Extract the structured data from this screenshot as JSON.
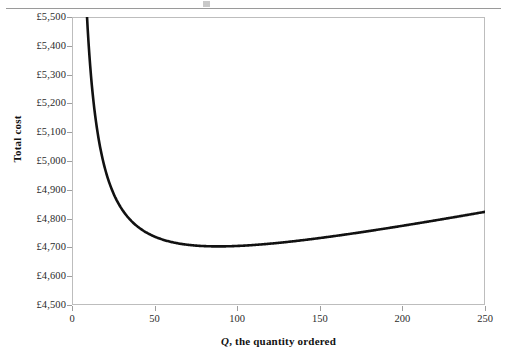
{
  "figure": {
    "top_rule": "horizontal-rule"
  },
  "chart_data": {
    "type": "line",
    "title": "",
    "subtitle": "",
    "xlabel_symbol": "Q",
    "xlabel_rest": ", the quantity ordered",
    "xlabel": "Q, the quantity ordered",
    "ylabel": "Total cost",
    "currency_symbol": "£",
    "grid": false,
    "legend": "none",
    "xlim": [
      0,
      250
    ],
    "ylim": [
      4500,
      5500
    ],
    "xticks": [
      0,
      50,
      100,
      150,
      200,
      250
    ],
    "xtick_labels": [
      "0",
      "50",
      "100",
      "150",
      "200",
      "250"
    ],
    "yticks": [
      4500,
      4600,
      4700,
      4800,
      4900,
      5000,
      5100,
      5200,
      5300,
      5400,
      5500
    ],
    "ytick_labels": [
      "£4,500",
      "£4,600",
      "£4,700",
      "£4,800",
      "£4,900",
      "£5,000",
      "£5,100",
      "£5,200",
      "£5,300",
      "£5,400",
      "£5,500"
    ],
    "series": [
      {
        "name": "Total cost",
        "color": "#111111",
        "line_width": 2.6,
        "x": [
          5,
          6,
          7,
          8,
          9,
          10,
          12,
          14,
          16,
          18,
          20,
          24,
          28,
          32,
          36,
          40,
          45,
          50,
          55,
          60,
          65,
          70,
          75,
          80,
          85,
          90,
          95,
          100,
          110,
          120,
          130,
          140,
          150,
          160,
          170,
          180,
          190,
          200,
          210,
          220,
          230,
          240,
          250
        ],
        "y": [
          6310.8,
          6007.0,
          5794.1,
          5634.2,
          5510.4,
          5411.5,
          5263.8,
          5159.1,
          5080.4,
          5020.7,
          4973.0,
          4902.6,
          4853.5,
          4818.3,
          4791.4,
          4771.0,
          4751.8,
          4737.5,
          4726.8,
          4719.0,
          4713.2,
          4909.0,
          4706.3,
          4704.5,
          4703.6,
          4703.5,
          4704.0,
          4705.0,
          4708.3,
          4213.0,
          4718.7,
          4725.3,
          4732.5,
          4740.3,
          4748.4,
          4757.0,
          4765.9,
          4775.0,
          4784.4,
          4794.0,
          4803.7,
          4813.5,
          4823.5
        ],
        "formula": "TC = 4500 + 9000/Q + 1.15Q",
        "minimum_point": {
          "x": 78,
          "y": 4670
        }
      }
    ],
    "annotations": []
  }
}
